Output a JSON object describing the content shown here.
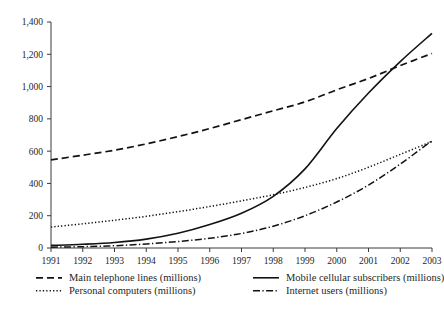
{
  "chart_data": {
    "type": "line",
    "title": "",
    "subtitle": "",
    "xlabel": "",
    "ylabel": "",
    "xlim": [
      1991,
      2003
    ],
    "ylim": [
      0,
      1400
    ],
    "grid": false,
    "legend_position": "bottom",
    "x": [
      1991,
      1992,
      1993,
      1994,
      1995,
      1996,
      1997,
      1998,
      1999,
      2000,
      2001,
      2002,
      2003
    ],
    "xtick_labels": [
      "1991",
      "1992",
      "1993",
      "1994",
      "1995",
      "1996",
      "1997",
      "1998",
      "1999",
      "2000",
      "2001",
      "2002",
      "2003"
    ],
    "ytick_labels": [
      "0",
      "200",
      "400",
      "600",
      "800",
      "1,000",
      "1,200",
      "1,400"
    ],
    "ytick_values": [
      0,
      200,
      400,
      600,
      800,
      1000,
      1200,
      1400
    ],
    "series": [
      {
        "name": "Main telephone lines (millions)",
        "style": "dashed",
        "values": [
          546,
          575,
          606,
          645,
          690,
          740,
          795,
          850,
          905,
          980,
          1050,
          1130,
          1205
        ]
      },
      {
        "name": "Mobile cellular subscribers (millions)",
        "style": "solid",
        "values": [
          16,
          23,
          34,
          55,
          91,
          145,
          215,
          320,
          490,
          740,
          960,
          1155,
          1330
        ]
      },
      {
        "name": "Personal computers (millions)",
        "style": "dotted",
        "values": [
          130,
          150,
          172,
          196,
          225,
          257,
          292,
          330,
          375,
          430,
          500,
          580,
          660
        ]
      },
      {
        "name": "Internet users (millions)",
        "style": "dashdot",
        "values": [
          5,
          8,
          14,
          25,
          40,
          60,
          90,
          135,
          200,
          285,
          390,
          520,
          665
        ]
      }
    ]
  },
  "legend": {
    "entries": [
      {
        "label": "Main telephone lines (millions)",
        "marker": "dashed-line-icon"
      },
      {
        "label": "Mobile cellular subscribers (millions)",
        "marker": "solid-line-icon"
      },
      {
        "label": "Personal computers (millions)",
        "marker": "dotted-line-icon"
      },
      {
        "label": "Internet users (millions)",
        "marker": "dashdot-line-icon"
      }
    ]
  },
  "colors": {
    "ink": "#121212",
    "axis": "#3a3a3a",
    "background": "#ffffff"
  }
}
